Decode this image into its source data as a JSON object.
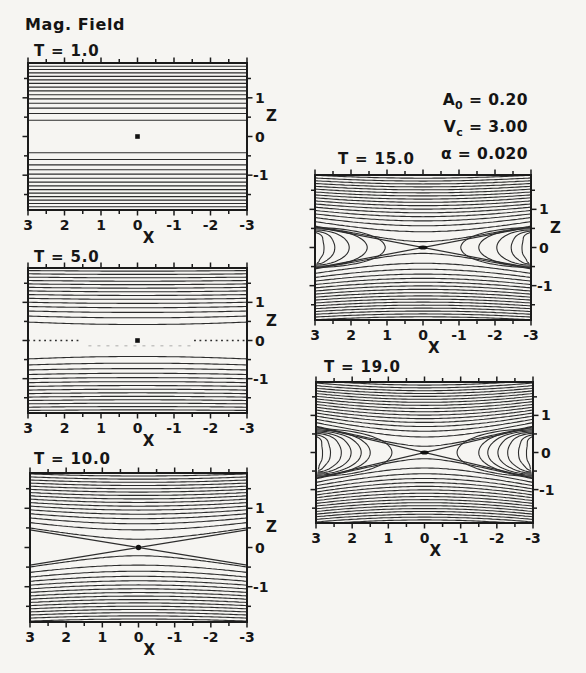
{
  "chart_data": {
    "type": "contour",
    "title": "Mag. Field",
    "xlabel": "X",
    "zlabel": "Z",
    "x_range": [
      3,
      -3
    ],
    "z_range": [
      -1.9,
      1.9
    ],
    "x_tick_values": [
      3,
      2,
      1,
      0,
      -1,
      -2,
      -3
    ],
    "x_tick_labels": [
      "3",
      "2",
      "1",
      "0",
      "-1",
      "-2",
      "-3"
    ],
    "z_tick_values": [
      1,
      0,
      -1
    ],
    "z_tick_labels": [
      "1",
      "0",
      "-1"
    ],
    "minor_tick_step": 0.5,
    "parameters": [
      {
        "symbol": "A",
        "subscript": "0",
        "value": "0.20"
      },
      {
        "symbol": "V",
        "subscript": "c",
        "value": "3.00"
      },
      {
        "symbol": "α",
        "subscript": "",
        "value": "0.020"
      }
    ],
    "panels": [
      {
        "title": "T = 1.0",
        "time": 1.0,
        "z_axis_name_shown": true,
        "model": {
          "lines_per_half": 15,
          "level_start": 0.085,
          "level_step": 0.082,
          "separatrix_slope": 0,
          "draw_separatrix": false,
          "islands": [],
          "dotted_midline": false,
          "faint_subline": false,
          "marker": {
            "type": "square",
            "size": 4.6
          }
        }
      },
      {
        "title": "T = 5.0",
        "time": 5.0,
        "z_axis_name_shown": true,
        "model": {
          "lines_per_half": 15,
          "level_start": 0.085,
          "level_step": 0.082,
          "separatrix_slope": 0.08,
          "draw_separatrix": false,
          "islands": [],
          "dotted_midline": true,
          "faint_subline": true,
          "marker": {
            "type": "square",
            "size": 4.6
          }
        }
      },
      {
        "title": "T = 10.0",
        "time": 10.0,
        "z_axis_name_shown": true,
        "model": {
          "lines_per_half": 17,
          "level_start": 0.022,
          "level_step": 0.0756,
          "separatrix_slope": 0.15,
          "draw_separatrix": true,
          "islands": [],
          "dotted_midline": false,
          "faint_subline": false,
          "marker": {
            "type": "circle",
            "size": 5.4
          }
        }
      },
      {
        "title": "T = 15.0",
        "time": 15.0,
        "z_axis_name_shown": true,
        "model": {
          "lines_per_half": 18,
          "level_start": 0.012,
          "level_step": 0.0711,
          "separatrix_slope": 0.18,
          "draw_separatrix": true,
          "islands": [
            {
              "a": 1.95,
              "b": 0.52,
              "w": 0
            },
            {
              "a": 1.45,
              "b": 0.49,
              "w": 0
            },
            {
              "a": 0.95,
              "b": 0.46,
              "w": 0.025
            },
            {
              "a": 0.55,
              "b": 0.43,
              "w": 0.06
            },
            {
              "a": 0.25,
              "b": 0.4,
              "w": 0.085
            }
          ],
          "dotted_midline": false,
          "faint_subline": false,
          "marker": {
            "type": "ellipse",
            "rx": 4.4,
            "ry": 2.1
          }
        }
      },
      {
        "title": "T = 19.0",
        "time": 19.0,
        "z_axis_name_shown": false,
        "model": {
          "lines_per_half": 18,
          "level_start": 0.014,
          "level_step": 0.071,
          "separatrix_slope": 0.23,
          "draw_separatrix": true,
          "islands": [
            {
              "a": 2.1,
              "b": 0.64,
              "w": 0
            },
            {
              "a": 1.5,
              "b": 0.61,
              "w": 0.03
            },
            {
              "a": 1.25,
              "b": 0.58,
              "w": 0.05
            },
            {
              "a": 0.97,
              "b": 0.55,
              "w": 0.06
            },
            {
              "a": 0.7,
              "b": 0.52,
              "w": 0.07
            },
            {
              "a": 0.4,
              "b": 0.48,
              "w": 0.08
            },
            {
              "a": 0.18,
              "b": 0.44,
              "w": 0.08
            }
          ],
          "dotted_midline": false,
          "faint_subline": false,
          "marker": {
            "type": "ellipse",
            "rx": 4.1,
            "ry": 2.1
          }
        }
      }
    ]
  }
}
